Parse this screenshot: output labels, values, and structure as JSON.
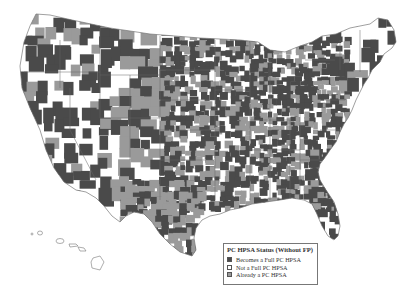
{
  "map": {
    "subject": "United States counties (contiguous US + Hawaii)",
    "categories": [
      {
        "key": "full",
        "label": "Becomes a Full PC HPSA",
        "color": "#4a4a4a"
      },
      {
        "key": "not",
        "label": "Not a Full PC HPSA",
        "color": "#ffffff"
      },
      {
        "key": "already",
        "label": "Already a PC HPSA",
        "color": "#9a9a9a"
      }
    ],
    "outline_color": "#777777"
  },
  "legend": {
    "title": "PC HPSA Status (Without FP)",
    "items": [
      {
        "label": "Becomes a Full PC HPSA",
        "color": "#4a4a4a"
      },
      {
        "label": "Not a Full PC HPSA",
        "color": "#ffffff"
      },
      {
        "label": "Already a PC HPSA",
        "color": "#9a9a9a"
      }
    ]
  }
}
